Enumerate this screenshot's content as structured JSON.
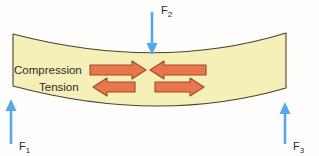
{
  "figure": {
    "name": "beam-bending-stress-diagram",
    "background_color": "#fdfdfb"
  },
  "beam": {
    "name": "beam",
    "fill_color": "#f5f0b8",
    "stroke_color": "#4a4233",
    "description": "sagging beam"
  },
  "forces": [
    {
      "id": "f1",
      "label": "F",
      "subscript": "1",
      "direction": "up",
      "color": "#56a9e8",
      "position": "bottom-left"
    },
    {
      "id": "f2",
      "label": "F",
      "subscript": "2",
      "direction": "down",
      "color": "#56a9e8",
      "position": "top-center"
    },
    {
      "id": "f3",
      "label": "F",
      "subscript": "3",
      "direction": "up",
      "color": "#56a9e8",
      "position": "bottom-right"
    }
  ],
  "stress_zones": [
    {
      "id": "compression",
      "label": "Compression",
      "arrow_fill": "#e8764e",
      "arrow_stroke": "#a8481f",
      "arrows": [
        {
          "id": "compression-arrow-left",
          "direction": "right"
        },
        {
          "id": "compression-arrow-right",
          "direction": "left"
        }
      ]
    },
    {
      "id": "tension",
      "label": "Tension",
      "arrow_fill": "#e8764e",
      "arrow_stroke": "#a8481f",
      "arrows": [
        {
          "id": "tension-arrow-left",
          "direction": "left"
        },
        {
          "id": "tension-arrow-right",
          "direction": "right"
        }
      ]
    }
  ]
}
